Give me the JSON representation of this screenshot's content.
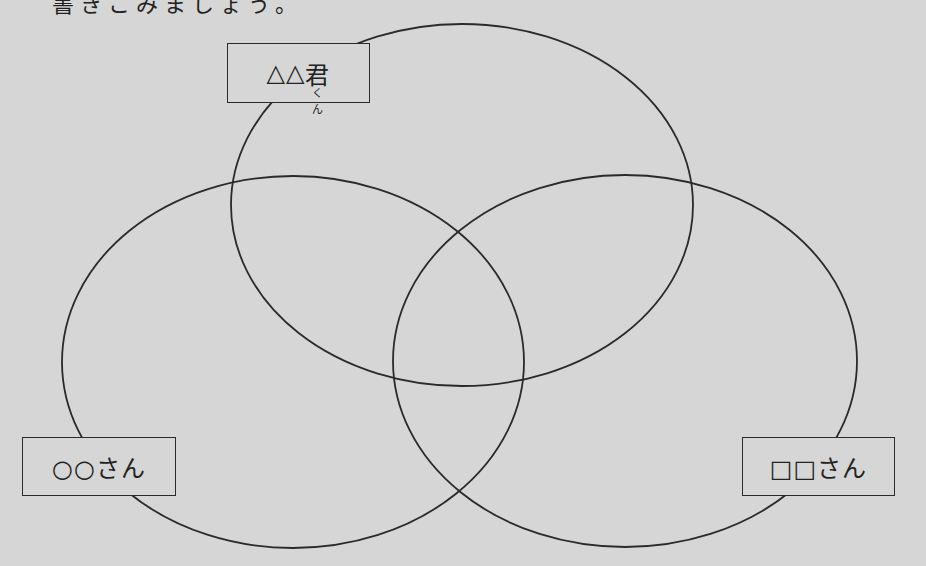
{
  "header": {
    "cut_off_text": "書きこみましょう。"
  },
  "diagram": {
    "type": "venn",
    "sets": [
      {
        "id": "top",
        "label_prefix": "△△",
        "label_kanji": "君",
        "label_ruby": "くん"
      },
      {
        "id": "left",
        "label": "○○さん"
      },
      {
        "id": "right",
        "label": "□□さん"
      }
    ],
    "colors": {
      "background": "#d6d6d6",
      "stroke": "#2a2a2a"
    }
  }
}
